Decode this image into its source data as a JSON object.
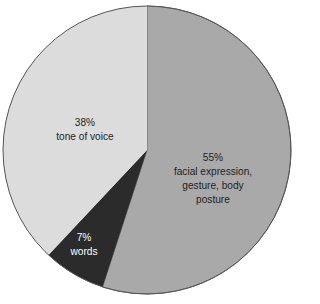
{
  "chart_data": {
    "type": "pie",
    "title": "",
    "start_angle_deg": 0,
    "direction": "clockwise",
    "slices": [
      {
        "label": "facial expression, gesture, body posture",
        "value": 55,
        "value_label": "55%",
        "label_lines": [
          "facial expression,",
          "gesture, body",
          "posture"
        ],
        "color": "#a9a9a9",
        "text_color": "#1e1e1e"
      },
      {
        "label": "words",
        "value": 7,
        "value_label": "7%",
        "label_lines": [
          "words"
        ],
        "color": "#2b2b2b",
        "text_color": "#ffffff"
      },
      {
        "label": "tone of voice",
        "value": 38,
        "value_label": "38%",
        "label_lines": [
          "tone of voice"
        ],
        "color": "#dcdcdc",
        "text_color": "#1e1e1e"
      }
    ],
    "categories": [
      "facial expression, gesture, body posture",
      "words",
      "tone of voice"
    ],
    "values": [
      55,
      7,
      38
    ],
    "legend": "none (labels inside slices)",
    "outline_color": "#555555"
  },
  "labels": {
    "facial": {
      "pct": "55%",
      "line1": "facial expression,",
      "line2": "gesture, body",
      "line3": "posture"
    },
    "words": {
      "pct": "7%",
      "line1": "words"
    },
    "tone": {
      "pct": "38%",
      "line1": "tone of voice"
    }
  }
}
